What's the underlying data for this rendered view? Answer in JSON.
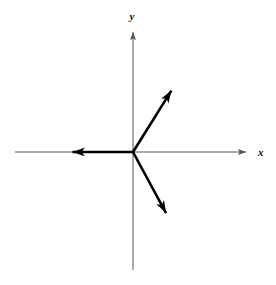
{
  "figure": {
    "background_color": "#ffffff",
    "width": 276,
    "height": 285
  },
  "axes": {
    "origin": {
      "x": 133,
      "y": 152
    },
    "color": "#555555",
    "x_axis": {
      "label": "x",
      "label_position": {
        "x": 261,
        "y": 152
      },
      "start": {
        "x": 15,
        "y": 152
      },
      "end": {
        "x": 250,
        "y": 152
      },
      "arrow_at": "end"
    },
    "y_axis": {
      "label": "y",
      "label_position": {
        "x": 132,
        "y": 16
      },
      "start": {
        "x": 133,
        "y": 270
      },
      "end": {
        "x": 133,
        "y": 28
      },
      "arrow_at": "end"
    }
  },
  "chart_data": {
    "type": "scatter",
    "title": "",
    "xlabel": "x",
    "ylabel": "y",
    "grid": false,
    "legend": null,
    "origin_px": {
      "x": 133,
      "y": 152
    },
    "vectors": [
      {
        "name": "vector-left",
        "tail_px": {
          "x": 133,
          "y": 152
        },
        "tip_px": {
          "x": 60,
          "y": 152
        },
        "length_px": 73,
        "angle_deg": 180,
        "color": "#000000",
        "stroke_width": 2.6
      },
      {
        "name": "vector-upper-right",
        "tail_px": {
          "x": 133,
          "y": 152
        },
        "tip_px": {
          "x": 178,
          "y": 80
        },
        "length_px": 85,
        "angle_deg": 58,
        "color": "#000000",
        "stroke_width": 2.6
      },
      {
        "name": "vector-lower-right",
        "tail_px": {
          "x": 133,
          "y": 152
        },
        "tip_px": {
          "x": 172,
          "y": 224
        },
        "length_px": 82,
        "angle_deg": -61.5,
        "color": "#000000",
        "stroke_width": 2.6
      }
    ]
  }
}
